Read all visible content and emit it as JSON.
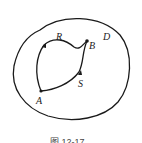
{
  "figure": {
    "caption": "图 12-17",
    "region_label": "D",
    "points": {
      "A": "A",
      "B": "B",
      "R": "R",
      "S": "S"
    },
    "stroke_color": "#1a1a1a"
  }
}
